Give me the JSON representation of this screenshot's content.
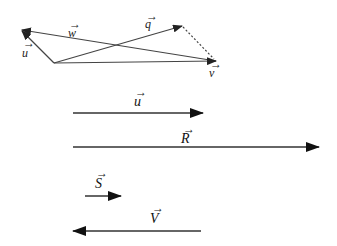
{
  "diagram": {
    "type": "vector-diagram",
    "colors": {
      "stroke": "#333333",
      "background": "#ffffff"
    },
    "top_figure": {
      "vectors": [
        {
          "name": "u",
          "label": "u",
          "from": [
            54,
            63
          ],
          "to": [
            21,
            30
          ],
          "style": "solid"
        },
        {
          "name": "w",
          "label": "w",
          "from": [
            216,
            61
          ],
          "to": [
            21,
            30
          ],
          "style": "solid"
        },
        {
          "name": "q",
          "label": "q",
          "from": [
            54,
            63
          ],
          "to": [
            182,
            26
          ],
          "style": "solid"
        },
        {
          "name": "v",
          "label": "v",
          "from": [
            54,
            63
          ],
          "to": [
            216,
            61
          ],
          "style": "solid"
        },
        {
          "name": "q-to-v",
          "label": "",
          "from": [
            182,
            26
          ],
          "to": [
            216,
            61
          ],
          "style": "dotted"
        }
      ]
    },
    "bottom_figure": {
      "vectors": [
        {
          "name": "u",
          "label": "u",
          "from": [
            73,
            113
          ],
          "to": [
            202,
            113
          ],
          "direction": "right"
        },
        {
          "name": "R",
          "label": "R",
          "from": [
            73,
            147
          ],
          "to": [
            318,
            147
          ],
          "direction": "right"
        },
        {
          "name": "S",
          "label": "S",
          "from": [
            85,
            196
          ],
          "to": [
            120,
            196
          ],
          "direction": "right"
        },
        {
          "name": "V",
          "label": "V",
          "from": [
            200,
            231
          ],
          "to": [
            73,
            231
          ],
          "direction": "left"
        }
      ]
    }
  },
  "labels": {
    "u_top": "u",
    "w_top": "w",
    "q_top": "q",
    "v_top": "v",
    "u_bottom": "u",
    "R": "R",
    "S": "S",
    "V": "V",
    "arrow_mark": "→"
  }
}
